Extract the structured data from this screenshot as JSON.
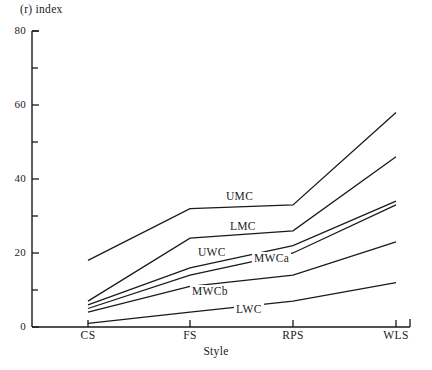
{
  "chart_data": {
    "type": "line",
    "title": "",
    "ylabel": "(r) index",
    "xlabel": "Style",
    "categories": [
      "CS",
      "FS",
      "RPS",
      "WLS"
    ],
    "ylim": [
      0,
      80
    ],
    "xlim_labels": [
      "CS",
      "FS",
      "RPS",
      "WLS"
    ],
    "grid": false,
    "legend_position": "inline-labels",
    "y_ticks_major": [
      0,
      20,
      40,
      60,
      80
    ],
    "y_ticks_minor": [
      10,
      30,
      50,
      70
    ],
    "y_tick_labels": [
      "0",
      "20",
      "40",
      "60",
      "80"
    ],
    "series": [
      {
        "name": "UMC",
        "values": [
          18,
          32,
          33,
          58
        ]
      },
      {
        "name": "LMC",
        "values": [
          7,
          24,
          26,
          46
        ]
      },
      {
        "name": "UWC",
        "values": [
          6,
          16,
          22,
          34
        ]
      },
      {
        "name": "MWCa",
        "values": [
          5,
          14,
          20,
          33
        ]
      },
      {
        "name": "MWCb",
        "values": [
          4,
          11,
          14,
          23
        ]
      },
      {
        "name": "LWC",
        "values": [
          1,
          4,
          7,
          12
        ]
      }
    ],
    "annotations": [
      {
        "text": "UMC",
        "x_px": 224,
        "y_px": 190
      },
      {
        "text": "LMC",
        "x_px": 228,
        "y_px": 220
      },
      {
        "text": "UWC",
        "x_px": 196,
        "y_px": 246
      },
      {
        "text": "MWCa",
        "x_px": 252,
        "y_px": 252
      },
      {
        "text": "MWCb",
        "x_px": 190,
        "y_px": 285
      },
      {
        "text": "LWC",
        "x_px": 234,
        "y_px": 303
      }
    ]
  },
  "colors": {
    "line": "#1a1a1a",
    "axis": "#1a1a1a",
    "background": "#ffffff"
  },
  "axis_geometry": {
    "x_origin_px": 32,
    "y_zero_px": 327,
    "y_top_px": 31,
    "y_top_value": 80,
    "category_x_px": [
      88,
      190,
      293,
      396
    ],
    "axis_right_px": 410
  }
}
